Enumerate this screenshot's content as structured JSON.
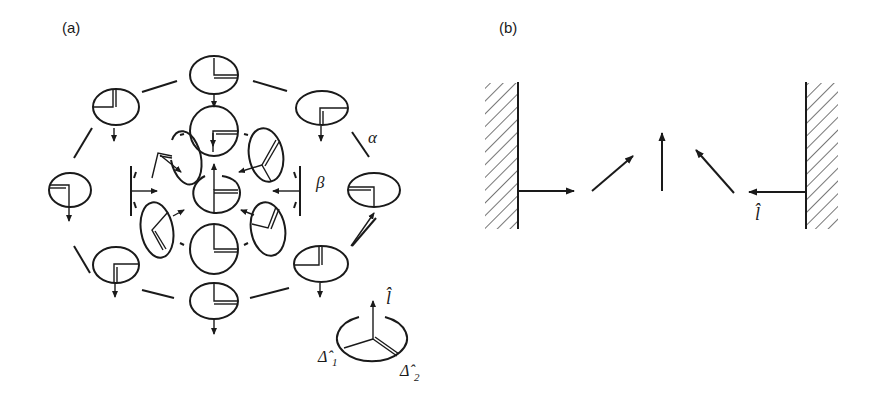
{
  "figure": {
    "panels": [
      {
        "id": "a",
        "label": "(a)",
        "rings": [
          {
            "name": "outer",
            "label": "α",
            "cells": 8
          },
          {
            "name": "inner",
            "label": "β",
            "cells": 6
          }
        ],
        "legend": {
          "vector_l": "l̂",
          "delta1": "Δ̂",
          "delta1_sub": "1",
          "delta2": "Δ̂",
          "delta2_sub": "2"
        }
      },
      {
        "id": "b",
        "label": "(b)",
        "arrows": [
          "right",
          "up-right",
          "up",
          "up-left",
          "left"
        ],
        "vector_label": "l̂",
        "walls": [
          "left",
          "right"
        ]
      }
    ]
  }
}
